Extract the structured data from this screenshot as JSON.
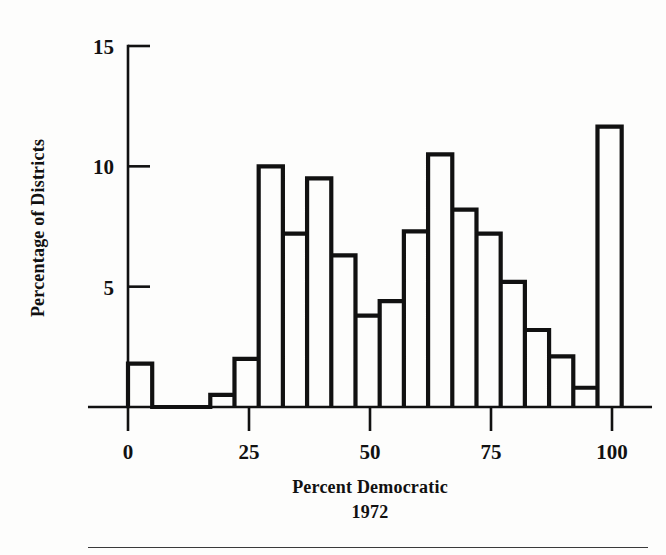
{
  "figure": {
    "background": "#fdfdfc",
    "ink": "#111111",
    "footer_rule_color": "#3a3a3a"
  },
  "chart_data": {
    "type": "bar",
    "subtype": "histogram",
    "title": "",
    "xlabel": "Percent Democratic",
    "xlabel_line2": "1972",
    "ylabel": "Percentage of Districts",
    "xlim": [
      -8,
      108
    ],
    "ylim": [
      0,
      15
    ],
    "xticks": [
      0,
      25,
      50,
      75,
      100
    ],
    "xtick_labels": [
      "0",
      "25",
      "50",
      "75",
      "100"
    ],
    "yticks": [
      5,
      10,
      15
    ],
    "ytick_labels": [
      "5",
      "10",
      "15"
    ],
    "grid": false,
    "legend": null,
    "bin_width": 5,
    "bin_edges": [
      0,
      5,
      17,
      22,
      27,
      32,
      37,
      42,
      47,
      52,
      57,
      62,
      67,
      72,
      77,
      82,
      87,
      92,
      97,
      102
    ],
    "bins": [
      {
        "x0": 0,
        "x1": 5,
        "value": 1.8
      },
      {
        "x0": 17,
        "x1": 22,
        "value": 0.5
      },
      {
        "x0": 22,
        "x1": 27,
        "value": 2.0
      },
      {
        "x0": 27,
        "x1": 32,
        "value": 10.0
      },
      {
        "x0": 32,
        "x1": 37,
        "value": 7.2
      },
      {
        "x0": 37,
        "x1": 42,
        "value": 9.5
      },
      {
        "x0": 42,
        "x1": 47,
        "value": 6.3
      },
      {
        "x0": 47,
        "x1": 52,
        "value": 3.8
      },
      {
        "x0": 52,
        "x1": 57,
        "value": 4.4
      },
      {
        "x0": 57,
        "x1": 62,
        "value": 7.3
      },
      {
        "x0": 62,
        "x1": 67,
        "value": 10.5
      },
      {
        "x0": 67,
        "x1": 72,
        "value": 8.2
      },
      {
        "x0": 72,
        "x1": 77,
        "value": 7.2
      },
      {
        "x0": 77,
        "x1": 82,
        "value": 5.2
      },
      {
        "x0": 82,
        "x1": 87,
        "value": 3.2
      },
      {
        "x0": 87,
        "x1": 92,
        "value": 2.1
      },
      {
        "x0": 92,
        "x1": 97,
        "value": 0.8
      },
      {
        "x0": 97,
        "x1": 102,
        "value": 11.65
      }
    ]
  }
}
